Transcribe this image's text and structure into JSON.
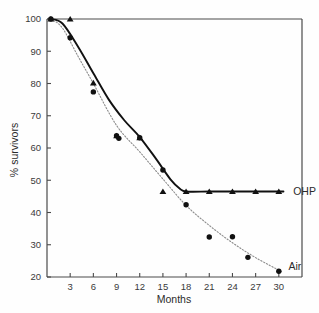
{
  "figure": {
    "background_color": "#fefefe",
    "frame_color": "#4a4a4a"
  },
  "chart_data": {
    "type": "line",
    "title": "",
    "subtitle": "",
    "xlabel": "Months",
    "ylabel": "% survivors",
    "xlim": [
      0,
      33
    ],
    "ylim": [
      20,
      100
    ],
    "xticks": [
      3,
      6,
      9,
      12,
      15,
      18,
      21,
      24,
      27,
      30
    ],
    "xtick_labels": [
      "3",
      "6",
      "9",
      "12",
      "15",
      "18",
      "21",
      "24",
      "27",
      "30"
    ],
    "yticks": [
      20,
      30,
      40,
      50,
      60,
      70,
      80,
      90,
      100
    ],
    "ytick_labels": [
      "20",
      "30",
      "40",
      "50",
      "60",
      "70",
      "80",
      "90",
      "100"
    ],
    "grid": false,
    "legend_position": "inline-right-end-of-line",
    "yscale": "log-like-survival",
    "series": [
      {
        "name": "OHP",
        "marker": "triangle",
        "line_style": "solid",
        "line_color": "#111111",
        "label_text": "OHP",
        "label_x": 31.6,
        "label_y": 46.5,
        "x": [
          0.5,
          3,
          6,
          9,
          12,
          15,
          18,
          21,
          24,
          27,
          30
        ],
        "y": [
          100,
          100,
          80.2,
          63.8,
          63.2,
          46.5,
          46.5,
          46.5,
          46.5,
          46.5,
          46.5
        ],
        "curve_x": [
          0.5,
          2,
          4,
          6,
          8,
          10,
          12,
          14,
          16,
          17.2,
          18,
          21,
          24,
          27,
          30.6
        ],
        "curve_y": [
          100,
          98.6,
          91.5,
          83.2,
          75.0,
          68.6,
          63.4,
          57.0,
          50.2,
          47.4,
          46.5,
          46.5,
          46.5,
          46.5,
          46.5
        ]
      },
      {
        "name": "Air",
        "marker": "circle",
        "line_style": "dotted",
        "line_color": "#8d8d8d",
        "label_text": "Air",
        "label_x": 31.0,
        "label_y": 23.2,
        "x": [
          0.5,
          3,
          6,
          9,
          9.3,
          12,
          15,
          18,
          21,
          24,
          26,
          30
        ],
        "y": [
          100,
          94.2,
          77.4,
          63.8,
          63.0,
          63.2,
          53.2,
          42.4,
          32.4,
          32.5,
          26.1,
          21.8
        ],
        "curve_x": [
          0.5,
          2,
          4,
          6,
          9,
          12,
          15,
          18,
          21,
          24,
          27,
          30.4
        ],
        "curve_y": [
          100,
          97.2,
          88.5,
          80.0,
          67.0,
          58.8,
          50.4,
          42.2,
          36.0,
          30.6,
          26.0,
          21.6
        ]
      }
    ],
    "annotations": [
      {
        "text": "OHP",
        "x": 31.6,
        "y": 46.5
      },
      {
        "text": "Air",
        "x": 31.0,
        "y": 23.2
      }
    ]
  }
}
